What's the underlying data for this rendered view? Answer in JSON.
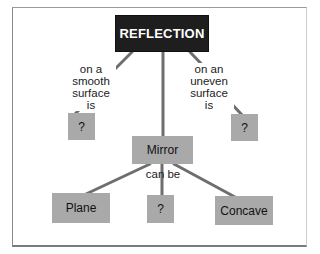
{
  "diagram": {
    "type": "concept-map",
    "root": {
      "label": "REFLECTION"
    },
    "nodes": {
      "smooth_answer": "?",
      "uneven_answer": "?",
      "mirror": "Mirror",
      "plane": "Plane",
      "middle_answer": "?",
      "concave": "Concave"
    },
    "links": {
      "smooth": "on a smooth surface is",
      "smooth_lines": [
        "on a",
        "smooth",
        "surface",
        "is"
      ],
      "uneven": "on an uneven surface is",
      "uneven_lines": [
        "on an",
        "uneven",
        "surface",
        "is"
      ],
      "can_be": "can be"
    },
    "colors": {
      "root_fill": "#1e1e1e",
      "node_fill": "#a9a9a9",
      "connector": "#6e6e6e"
    }
  }
}
